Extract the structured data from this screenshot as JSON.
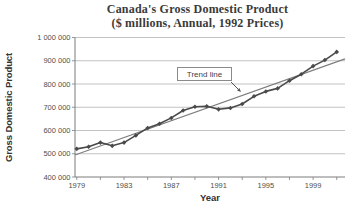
{
  "title": {
    "line1": "Canada's Gross Domestic Product",
    "line2": "($ millions, Annual, 1992 Prices)"
  },
  "chart_data": {
    "type": "line",
    "title": "Canada's Gross Domestic Product ($ millions, Annual, 1992 Prices)",
    "xlabel": "Year",
    "ylabel": "Gross Domestic Product",
    "x": [
      1979,
      1980,
      1981,
      1982,
      1983,
      1984,
      1985,
      1986,
      1987,
      1988,
      1989,
      1990,
      1991,
      1992,
      1993,
      1994,
      1995,
      1996,
      1997,
      1998,
      1999,
      2000,
      2001
    ],
    "series": [
      {
        "name": "GDP ($ millions, 1992 prices)",
        "values": [
          521000,
          530000,
          548000,
          534000,
          548000,
          579000,
          611000,
          629000,
          654000,
          686000,
          702000,
          704000,
          691000,
          697000,
          714000,
          747000,
          768000,
          781000,
          814000,
          842000,
          877000,
          903000,
          938000
        ]
      }
    ],
    "trend_line": {
      "label": "Trend line",
      "x": [
        1978.85,
        2001.7
      ],
      "values": [
        495000,
        908000
      ]
    },
    "xlim": [
      1978.85,
      2001.7
    ],
    "ylim": [
      400000,
      1000000
    ],
    "x_major_tick_years": [
      1979,
      1983,
      1987,
      1991,
      1995,
      1999
    ],
    "x_major_tick_labels": [
      "1979",
      "1983",
      "1987",
      "1991",
      "1995",
      "1999"
    ],
    "x_minor_tick_start": 1979,
    "x_minor_tick_end": 2001,
    "x_minor_tick_step": 2,
    "y_tick_values": [
      400000,
      500000,
      600000,
      700000,
      800000,
      900000,
      1000000
    ],
    "y_tick_labels": [
      "400 000",
      "500 000",
      "600 000",
      "700 000",
      "800 000",
      "900 000",
      "1 000 000"
    ],
    "grid": "horizontal",
    "legend": "none"
  },
  "colors": {
    "data_line": "#4a4a4a",
    "marker": "#4a4a4a",
    "trend_line": "#7d7d7d",
    "grid": "#a9a9a9",
    "axis": "#7c7c7c",
    "tick_text": "#4f4f4f",
    "title_text": "#3a3a3a"
  }
}
